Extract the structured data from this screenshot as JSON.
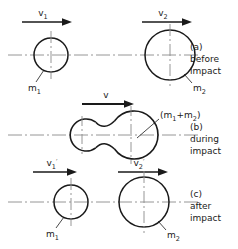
{
  "figure": {
    "stroke_color": "#1a1a1a",
    "centerline_color": "#8a8a8a",
    "background": "#ffffff",
    "width": 238,
    "height": 249
  },
  "panels": [
    {
      "id": "a",
      "caption_tag": "(a)",
      "caption_line1": "before",
      "caption_line2": "impact",
      "velocity_labels": [
        {
          "base": "v",
          "sub": "1",
          "prime": ""
        },
        {
          "base": "v",
          "sub": "2",
          "prime": ""
        }
      ],
      "mass_labels": [
        {
          "base": "m",
          "sub": "1"
        },
        {
          "base": "m",
          "sub": "2"
        }
      ]
    },
    {
      "id": "b",
      "caption_tag": "(b)",
      "caption_line1": "during",
      "caption_line2": "impact",
      "velocity_labels": [
        {
          "base": "v",
          "sub": "",
          "prime": ""
        }
      ],
      "mass_labels": [
        {
          "base": "(m",
          "sub": "1",
          "plus": "+m",
          "sub2": "2",
          "close": ")"
        }
      ],
      "combined_mass_label": "(m1+m2)"
    },
    {
      "id": "c",
      "caption_tag": "(c)",
      "caption_line1": "after",
      "caption_line2": "impact",
      "velocity_labels": [
        {
          "base": "v",
          "sub": "1",
          "prime": "′"
        },
        {
          "base": "v",
          "sub": "2",
          "prime": "′"
        }
      ],
      "mass_labels": [
        {
          "base": "m",
          "sub": "1"
        },
        {
          "base": "m",
          "sub": "2"
        }
      ]
    }
  ],
  "glyphs": {
    "prime": "′",
    "plus": "+",
    "paren_open": "(",
    "paren_close": ")"
  }
}
